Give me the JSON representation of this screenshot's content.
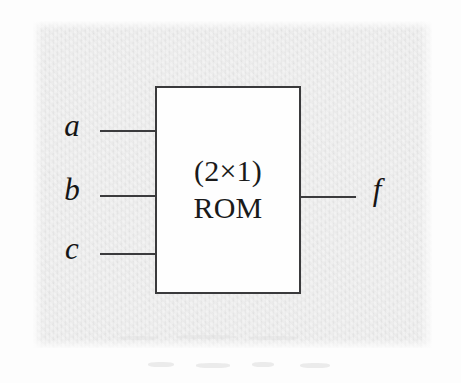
{
  "figure": {
    "kind": "logic-block-diagram",
    "block": {
      "size_label": "(2×1)",
      "device_label": "ROM",
      "fill_color": "#fefefe",
      "border_color": "#3a3a3c"
    },
    "inputs": [
      {
        "name": "a",
        "label": "a"
      },
      {
        "name": "b",
        "label": "b"
      },
      {
        "name": "c",
        "label": "c"
      }
    ],
    "outputs": [
      {
        "name": "f",
        "label": "f"
      }
    ],
    "background_color": "#e4e4e4",
    "ink_color": "#151515"
  }
}
